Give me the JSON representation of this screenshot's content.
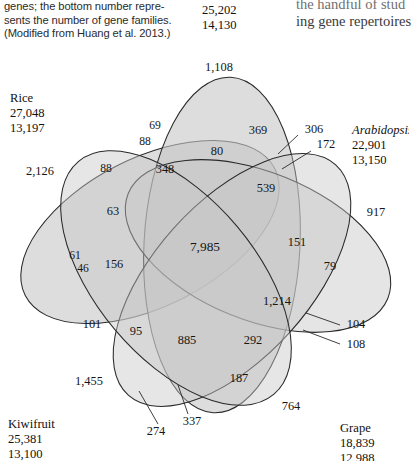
{
  "caption": {
    "lines": [
      "genes; the bottom number repre-",
      "sents the number of gene families.",
      "(Modified from Huang et al. 2013.)"
    ]
  },
  "right_column": {
    "lines": [
      "the handful of stud",
      "ing gene repertoires"
    ]
  },
  "chart_data": {
    "type": "venn",
    "sets": [
      {
        "key": "top",
        "name": "",
        "genes": "25,202",
        "families": "14,130",
        "label_x": 202,
        "label_y": 4,
        "name_visible": false
      },
      {
        "key": "rice",
        "name": "Rice",
        "genes": "27,048",
        "families": "13,197",
        "label_x": 10,
        "label_y": 92,
        "name_visible": true
      },
      {
        "key": "arabidopsis",
        "name": "Arabidopsis",
        "genes": "22,901",
        "families": "13,150",
        "label_x": 352,
        "label_y": 124,
        "name_visible": true,
        "italic": true
      },
      {
        "key": "kiwifruit",
        "name": "Kiwifruit",
        "genes": "25,381",
        "families": "13,100",
        "label_x": 8,
        "label_y": 418,
        "name_visible": true
      },
      {
        "key": "grape",
        "name": "Grape",
        "genes": "18,839",
        "families": "12,988",
        "label_x": 340,
        "label_y": 422,
        "name_visible": true
      }
    ],
    "regions": [
      {
        "id": "r01",
        "value": "1,108",
        "x": 219,
        "y": 68,
        "size": "normal"
      },
      {
        "id": "r02",
        "value": "2,126",
        "x": 40,
        "y": 172,
        "size": "normal"
      },
      {
        "id": "r03",
        "value": "917",
        "x": 376,
        "y": 213,
        "size": "normal"
      },
      {
        "id": "r04",
        "value": "1,455",
        "x": 89,
        "y": 382,
        "size": "normal"
      },
      {
        "id": "r05",
        "value": "764",
        "x": 291,
        "y": 407,
        "size": "normal"
      },
      {
        "id": "r06",
        "value": "69",
        "x": 155,
        "y": 126,
        "size": "small"
      },
      {
        "id": "r07",
        "value": "88",
        "x": 145,
        "y": 142,
        "size": "small"
      },
      {
        "id": "r08",
        "value": "88",
        "x": 106,
        "y": 169,
        "size": "small"
      },
      {
        "id": "r09",
        "value": "348",
        "x": 165,
        "y": 170,
        "size": "normal"
      },
      {
        "id": "r10",
        "value": "80",
        "x": 217,
        "y": 152,
        "size": "normal"
      },
      {
        "id": "r11",
        "value": "369",
        "x": 258,
        "y": 131,
        "size": "normal"
      },
      {
        "id": "r12",
        "value": "539",
        "x": 266,
        "y": 189,
        "size": "normal"
      },
      {
        "id": "r13",
        "value": "63",
        "x": 113,
        "y": 212,
        "size": "normal"
      },
      {
        "id": "r14",
        "value": "61",
        "x": 75,
        "y": 256,
        "size": "small"
      },
      {
        "id": "r15",
        "value": "46",
        "x": 83,
        "y": 269,
        "size": "small"
      },
      {
        "id": "r16",
        "value": "156",
        "x": 114,
        "y": 265,
        "size": "normal"
      },
      {
        "id": "r17",
        "value": "7,985",
        "x": 205,
        "y": 248,
        "size": "big"
      },
      {
        "id": "r18",
        "value": "151",
        "x": 297,
        "y": 243,
        "size": "normal"
      },
      {
        "id": "r19",
        "value": "79",
        "x": 330,
        "y": 267,
        "size": "normal"
      },
      {
        "id": "r20",
        "value": "1,214",
        "x": 277,
        "y": 302,
        "size": "normal"
      },
      {
        "id": "r21",
        "value": "101",
        "x": 92,
        "y": 325,
        "size": "normal"
      },
      {
        "id": "r22",
        "value": "95",
        "x": 136,
        "y": 332,
        "size": "normal"
      },
      {
        "id": "r23",
        "value": "885",
        "x": 187,
        "y": 341,
        "size": "normal"
      },
      {
        "id": "r24",
        "value": "292",
        "x": 253,
        "y": 341,
        "size": "normal"
      },
      {
        "id": "r25",
        "value": "187",
        "x": 239,
        "y": 379,
        "size": "normal"
      }
    ],
    "callouts": [
      {
        "id": "c1",
        "value": "306",
        "text_x": 314,
        "text_y": 130,
        "line": "M 298,135 L 278,154"
      },
      {
        "id": "c2",
        "value": "172",
        "text_x": 326,
        "text_y": 145,
        "line": "M 311,151 L 282,169"
      },
      {
        "id": "c3",
        "value": "104",
        "text_x": 356,
        "text_y": 325,
        "line": "M 340,325 L 306,313"
      },
      {
        "id": "c4",
        "value": "108",
        "text_x": 356,
        "text_y": 345,
        "line": "M 340,344 L 303,330"
      },
      {
        "id": "c5",
        "value": "274",
        "text_x": 156,
        "text_y": 432,
        "line": "M 158,424 L 139,391"
      },
      {
        "id": "c6",
        "value": "337",
        "text_x": 192,
        "text_y": 422,
        "line": "M 188,414 L 178,385"
      }
    ],
    "ellipses": [
      {
        "key": "rice",
        "cx": 150,
        "cy": 232,
        "rx": 140,
        "ry": 74,
        "rot": -27,
        "fill": "#c8c8c8",
        "opacity": 0.62
      },
      {
        "key": "top",
        "cx": 222,
        "cy": 245,
        "rx": 78,
        "ry": 168,
        "rot": 3,
        "fill": "#c8c8c8",
        "opacity": 0.62
      },
      {
        "key": "arabidopsis",
        "cx": 258,
        "cy": 246,
        "rx": 140,
        "ry": 74,
        "rot": 22,
        "fill": "#c8c8c8",
        "opacity": 0.48
      },
      {
        "key": "grape",
        "cx": 232,
        "cy": 280,
        "rx": 78,
        "ry": 155,
        "rot": 42,
        "fill": "#c8c8c8",
        "opacity": 0.48
      },
      {
        "key": "kiwifruit",
        "cx": 176,
        "cy": 278,
        "rx": 80,
        "ry": 152,
        "rot": -40,
        "fill": "#c8c8c8",
        "opacity": 0.48
      }
    ]
  }
}
